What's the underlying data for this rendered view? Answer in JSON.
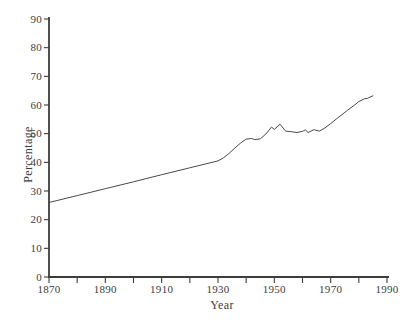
{
  "figure": {
    "background": "#ffffff",
    "ink_color": "#3d3d3d",
    "line_color": "#4a4a4a"
  },
  "chart_data": {
    "type": "line",
    "title": "",
    "xlabel": "Year",
    "ylabel": "Percentage",
    "xlim": [
      1870,
      1990
    ],
    "ylim": [
      0,
      90
    ],
    "x_tick_step": 10,
    "x_label_step": 20,
    "y_tick_step": 10,
    "x_tick_labels": [
      "1870",
      "1890",
      "1910",
      "1930",
      "1950",
      "1970",
      "1990"
    ],
    "y_tick_labels": [
      "0",
      "10",
      "20",
      "30",
      "40",
      "50",
      "60",
      "70",
      "80",
      "90"
    ],
    "grid": false,
    "legend": "none",
    "series": [
      {
        "name": "percentage",
        "points": [
          [
            1870,
            26.0
          ],
          [
            1880,
            28.4
          ],
          [
            1890,
            30.8
          ],
          [
            1900,
            33.2
          ],
          [
            1910,
            35.7
          ],
          [
            1920,
            38.1
          ],
          [
            1930,
            40.5
          ],
          [
            1932,
            41.6
          ],
          [
            1934,
            43.2
          ],
          [
            1936,
            45.0
          ],
          [
            1938,
            46.7
          ],
          [
            1940,
            48.1
          ],
          [
            1942,
            48.3
          ],
          [
            1943,
            47.9
          ],
          [
            1945,
            48.2
          ],
          [
            1947,
            49.9
          ],
          [
            1949,
            52.3
          ],
          [
            1950,
            51.5
          ],
          [
            1952,
            53.3
          ],
          [
            1954,
            50.9
          ],
          [
            1956,
            50.7
          ],
          [
            1958,
            50.4
          ],
          [
            1960,
            50.8
          ],
          [
            1961,
            51.3
          ],
          [
            1962,
            50.4
          ],
          [
            1964,
            51.4
          ],
          [
            1966,
            50.9
          ],
          [
            1968,
            52.0
          ],
          [
            1970,
            53.5
          ],
          [
            1972,
            55.1
          ],
          [
            1974,
            56.6
          ],
          [
            1976,
            58.2
          ],
          [
            1978,
            59.6
          ],
          [
            1980,
            61.2
          ],
          [
            1982,
            62.2
          ],
          [
            1983,
            62.3
          ],
          [
            1985,
            63.2
          ]
        ]
      }
    ]
  }
}
